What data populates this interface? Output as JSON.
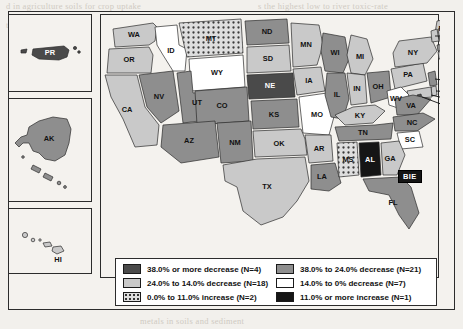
{
  "figure": {
    "frame_present": true,
    "bie_marker": "BIE"
  },
  "legend": {
    "items": [
      {
        "label": "38.0% or more decrease (N=4)",
        "fill": "#4a4a4a",
        "pattern": "solid",
        "order": 1
      },
      {
        "label": "38.0% to 24.0% decrease (N=21)",
        "fill": "#8e8e8e",
        "pattern": "solid",
        "order": 2
      },
      {
        "label": "24.0% to 14.0% decrease (N=18)",
        "fill": "#c9c9c9",
        "pattern": "solid",
        "order": 3
      },
      {
        "label": "14.0% to 0% decrease (N=7)",
        "fill": "#ffffff",
        "pattern": "solid",
        "order": 4
      },
      {
        "label": "0.0% to 11.0% increase (N=2)",
        "fill": "#d8d8d8",
        "pattern": "dots",
        "order": 5
      },
      {
        "label": "11.0% or more increase (N=1)",
        "fill": "#151515",
        "pattern": "solid",
        "order": 6
      }
    ]
  },
  "insets": [
    {
      "id": "PR",
      "label": "PR",
      "category": 1
    },
    {
      "id": "AK",
      "label": "AK",
      "category": 2
    },
    {
      "id": "HI",
      "label": "HI",
      "category": 3
    }
  ],
  "map": {
    "labeled_on_state": [
      "WA",
      "OR",
      "CA",
      "NV",
      "ID",
      "MT",
      "WY",
      "UT",
      "CO",
      "AZ",
      "NM",
      "TX",
      "OK",
      "KS",
      "NE",
      "SD",
      "ND",
      "MN",
      "IA",
      "MO",
      "AR",
      "LA",
      "MS",
      "AL",
      "GA",
      "FL",
      "SC",
      "NC",
      "TN",
      "KY",
      "VA",
      "WV",
      "OH",
      "IN",
      "IL",
      "MI",
      "WI",
      "PA",
      "NY",
      "ME"
    ],
    "callout_labels": [
      "VT",
      "NH",
      "MA",
      "RI",
      "CT",
      "NJ",
      "DE",
      "MD",
      "DC"
    ],
    "state_categories": {
      "WA": 3,
      "OR": 3,
      "CA": 3,
      "NV": 2,
      "ID": 4,
      "MT": 5,
      "WY": 4,
      "UT": 2,
      "CO": 2,
      "AZ": 2,
      "NM": 2,
      "TX": 3,
      "OK": 3,
      "KS": 2,
      "NE": 1,
      "SD": 3,
      "ND": 2,
      "MN": 3,
      "IA": 3,
      "MO": 4,
      "AR": 3,
      "LA": 2,
      "MS": 5,
      "AL": 6,
      "GA": 3,
      "FL": 2,
      "SC": 4,
      "NC": 3,
      "TN": 2,
      "KY": 3,
      "VA": 2,
      "WV": 4,
      "OH": 2,
      "IN": 3,
      "IL": 2,
      "MI": 3,
      "WI": 2,
      "PA": 3,
      "NY": 3,
      "ME": 3,
      "VT": 3,
      "NH": 3,
      "MA": 2,
      "RI": 3,
      "CT": 3,
      "NJ": 2,
      "DE": 3,
      "MD": 3,
      "DC": 1,
      "PR": 1,
      "AK": 2,
      "HI": 3
    }
  },
  "background_text": {
    "line_top_1": "d in agriculture soils for crop uptake",
    "line_top_2": "ter in cycle (GO) in the major cycle(s)",
    "line_top_3": "ly are addressed in the Key Metals",
    "line_right_1": "s the highest low to river toxic-rate",
    "line_right_2": "ances of the leaching",
    "line_right_3": "where C of contaminant",
    "line_right_4": "on the highest for specific and in the",
    "line_right_5": "the lighter, of and new records",
    "line_bottom_1": "metals in soils and sediment"
  }
}
